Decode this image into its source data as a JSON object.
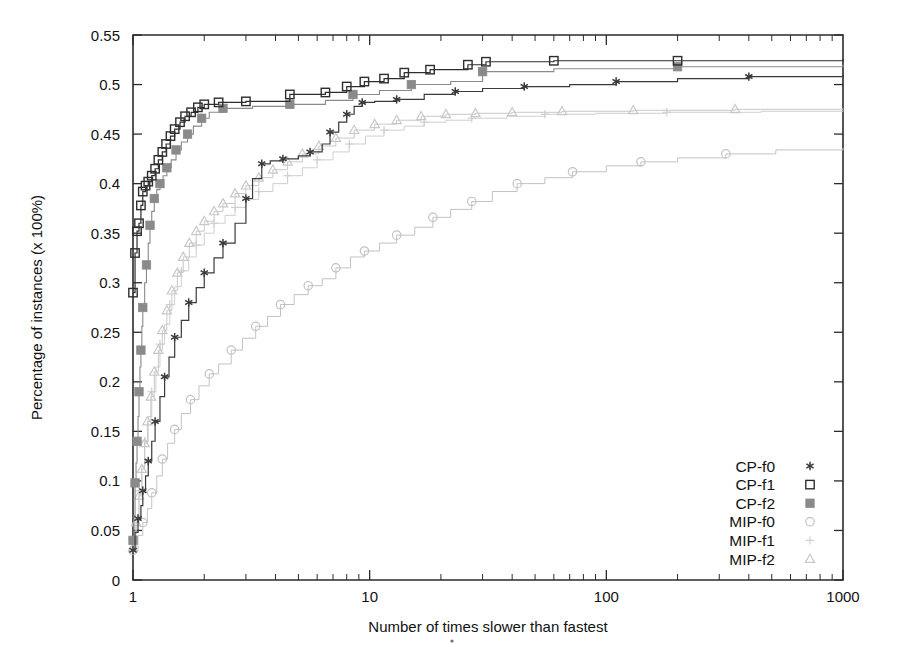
{
  "chart_data": {
    "type": "line",
    "title": "",
    "subtitle": "",
    "xlabel": "Number of times slower than fastest",
    "ylabel": "Percentage of instances (x 100%)",
    "xscale": "log",
    "yscale": "linear",
    "xlim": [
      1,
      1000
    ],
    "ylim": [
      0,
      0.55
    ],
    "xticks": [
      1,
      10,
      100,
      1000
    ],
    "xticklabels": [
      "1",
      "10",
      "100",
      "1000"
    ],
    "yticks": [
      0,
      0.05,
      0.1,
      0.15,
      0.2,
      0.25,
      0.3,
      0.35,
      0.4,
      0.45,
      0.5,
      0.55
    ],
    "yticklabels": [
      "0",
      "0.05",
      "0.1",
      "0.15",
      "0.2",
      "0.25",
      "0.3",
      "0.35",
      "0.4",
      "0.45",
      "0.5",
      "0.55"
    ],
    "grid": false,
    "legend_position": "lower-right",
    "legend": [
      {
        "name": "CP-f0",
        "marker": "asterisk",
        "color": "#3a3a3a"
      },
      {
        "name": "CP-f1",
        "marker": "open-square",
        "color": "#2e2e2e"
      },
      {
        "name": "CP-f2",
        "marker": "filled-square",
        "color": "#8a8a8a"
      },
      {
        "name": "MIP-f0",
        "marker": "open-circle",
        "color": "#c2c2c2"
      },
      {
        "name": "MIP-f1",
        "marker": "plus",
        "color": "#cfcfcf"
      },
      {
        "name": "MIP-f2",
        "marker": "open-triangle",
        "color": "#c8c8c8"
      }
    ],
    "series": [
      {
        "name": "CP-f0",
        "marker": "asterisk",
        "color": "#3a3a3a",
        "linewidth": 1.2,
        "points": [
          [
            1.0,
            0.03
          ],
          [
            1.02,
            0.048
          ],
          [
            1.05,
            0.062
          ],
          [
            1.08,
            0.075
          ],
          [
            1.1,
            0.09
          ],
          [
            1.13,
            0.105
          ],
          [
            1.16,
            0.12
          ],
          [
            1.2,
            0.14
          ],
          [
            1.24,
            0.16
          ],
          [
            1.3,
            0.185
          ],
          [
            1.36,
            0.205
          ],
          [
            1.42,
            0.225
          ],
          [
            1.5,
            0.245
          ],
          [
            1.6,
            0.262
          ],
          [
            1.72,
            0.28
          ],
          [
            1.85,
            0.295
          ],
          [
            2.0,
            0.31
          ],
          [
            2.2,
            0.325
          ],
          [
            2.4,
            0.34
          ],
          [
            2.7,
            0.36
          ],
          [
            3.0,
            0.385
          ],
          [
            3.2,
            0.405
          ],
          [
            3.5,
            0.42
          ],
          [
            3.8,
            0.423
          ],
          [
            4.3,
            0.425
          ],
          [
            5.0,
            0.428
          ],
          [
            5.6,
            0.432
          ],
          [
            6.3,
            0.44
          ],
          [
            6.8,
            0.452
          ],
          [
            7.4,
            0.462
          ],
          [
            8.0,
            0.47
          ],
          [
            8.6,
            0.478
          ],
          [
            9.3,
            0.482
          ],
          [
            10.5,
            0.483
          ],
          [
            13.0,
            0.485
          ],
          [
            17.0,
            0.49
          ],
          [
            23.0,
            0.493
          ],
          [
            30.0,
            0.496
          ],
          [
            45.0,
            0.498
          ],
          [
            70.0,
            0.5
          ],
          [
            110.0,
            0.503
          ],
          [
            200.0,
            0.506
          ],
          [
            400.0,
            0.508
          ],
          [
            1000.0,
            0.51
          ]
        ]
      },
      {
        "name": "CP-f1",
        "marker": "open-square",
        "color": "#2e2e2e",
        "linewidth": 1.2,
        "points": [
          [
            1.0,
            0.29
          ],
          [
            1.02,
            0.33
          ],
          [
            1.04,
            0.352
          ],
          [
            1.06,
            0.36
          ],
          [
            1.08,
            0.378
          ],
          [
            1.1,
            0.392
          ],
          [
            1.13,
            0.398
          ],
          [
            1.16,
            0.402
          ],
          [
            1.2,
            0.408
          ],
          [
            1.24,
            0.415
          ],
          [
            1.28,
            0.424
          ],
          [
            1.33,
            0.432
          ],
          [
            1.38,
            0.44
          ],
          [
            1.44,
            0.448
          ],
          [
            1.5,
            0.455
          ],
          [
            1.58,
            0.462
          ],
          [
            1.66,
            0.468
          ],
          [
            1.76,
            0.472
          ],
          [
            1.88,
            0.477
          ],
          [
            2.0,
            0.48
          ],
          [
            2.3,
            0.482
          ],
          [
            3.0,
            0.483
          ],
          [
            4.6,
            0.49
          ],
          [
            6.5,
            0.492
          ],
          [
            8.0,
            0.498
          ],
          [
            9.5,
            0.503
          ],
          [
            11.5,
            0.506
          ],
          [
            14.0,
            0.512
          ],
          [
            18.0,
            0.515
          ],
          [
            26.0,
            0.52
          ],
          [
            31.0,
            0.523
          ],
          [
            60.0,
            0.524
          ],
          [
            200.0,
            0.524
          ],
          [
            1000.0,
            0.526
          ]
        ]
      },
      {
        "name": "CP-f2",
        "marker": "filled-square",
        "color": "#8a8a8a",
        "linewidth": 1.1,
        "points": [
          [
            1.0,
            0.04
          ],
          [
            1.01,
            0.065
          ],
          [
            1.02,
            0.098
          ],
          [
            1.03,
            0.118
          ],
          [
            1.04,
            0.14
          ],
          [
            1.05,
            0.165
          ],
          [
            1.06,
            0.19
          ],
          [
            1.07,
            0.215
          ],
          [
            1.08,
            0.232
          ],
          [
            1.09,
            0.256
          ],
          [
            1.1,
            0.275
          ],
          [
            1.12,
            0.3
          ],
          [
            1.14,
            0.318
          ],
          [
            1.16,
            0.34
          ],
          [
            1.18,
            0.358
          ],
          [
            1.2,
            0.372
          ],
          [
            1.23,
            0.385
          ],
          [
            1.26,
            0.394
          ],
          [
            1.3,
            0.4
          ],
          [
            1.34,
            0.408
          ],
          [
            1.39,
            0.416
          ],
          [
            1.45,
            0.424
          ],
          [
            1.52,
            0.434
          ],
          [
            1.6,
            0.442
          ],
          [
            1.7,
            0.45
          ],
          [
            1.8,
            0.458
          ],
          [
            1.95,
            0.466
          ],
          [
            2.1,
            0.472
          ],
          [
            2.4,
            0.476
          ],
          [
            3.2,
            0.478
          ],
          [
            4.6,
            0.48
          ],
          [
            6.5,
            0.484
          ],
          [
            8.5,
            0.49
          ],
          [
            11.0,
            0.494
          ],
          [
            15.0,
            0.5
          ],
          [
            22.0,
            0.503
          ],
          [
            30.0,
            0.513
          ],
          [
            60.0,
            0.516
          ],
          [
            200.0,
            0.518
          ],
          [
            1000.0,
            0.52
          ]
        ]
      },
      {
        "name": "MIP-f0",
        "marker": "open-circle",
        "color": "#c2c2c2",
        "linewidth": 1.0,
        "points": [
          [
            1.0,
            0.03
          ],
          [
            1.05,
            0.045
          ],
          [
            1.1,
            0.058
          ],
          [
            1.15,
            0.072
          ],
          [
            1.2,
            0.088
          ],
          [
            1.26,
            0.105
          ],
          [
            1.33,
            0.122
          ],
          [
            1.4,
            0.138
          ],
          [
            1.5,
            0.152
          ],
          [
            1.6,
            0.168
          ],
          [
            1.75,
            0.182
          ],
          [
            1.9,
            0.196
          ],
          [
            2.1,
            0.208
          ],
          [
            2.3,
            0.218
          ],
          [
            2.6,
            0.232
          ],
          [
            2.9,
            0.244
          ],
          [
            3.3,
            0.256
          ],
          [
            3.7,
            0.266
          ],
          [
            4.2,
            0.278
          ],
          [
            4.8,
            0.288
          ],
          [
            5.5,
            0.297
          ],
          [
            6.3,
            0.304
          ],
          [
            7.2,
            0.315
          ],
          [
            8.3,
            0.326
          ],
          [
            9.5,
            0.332
          ],
          [
            11.0,
            0.34
          ],
          [
            13.0,
            0.348
          ],
          [
            15.5,
            0.356
          ],
          [
            18.5,
            0.366
          ],
          [
            22.0,
            0.374
          ],
          [
            27.0,
            0.382
          ],
          [
            33.0,
            0.392
          ],
          [
            42.0,
            0.4
          ],
          [
            55.0,
            0.406
          ],
          [
            72.0,
            0.412
          ],
          [
            100.0,
            0.418
          ],
          [
            140.0,
            0.422
          ],
          [
            200.0,
            0.426
          ],
          [
            320.0,
            0.43
          ],
          [
            520.0,
            0.434
          ],
          [
            1000.0,
            0.436
          ]
        ]
      },
      {
        "name": "MIP-f1",
        "marker": "plus",
        "color": "#cfcfcf",
        "linewidth": 1.0,
        "points": [
          [
            1.0,
            0.03
          ],
          [
            1.03,
            0.06
          ],
          [
            1.06,
            0.09
          ],
          [
            1.09,
            0.115
          ],
          [
            1.12,
            0.14
          ],
          [
            1.16,
            0.165
          ],
          [
            1.2,
            0.19
          ],
          [
            1.25,
            0.215
          ],
          [
            1.3,
            0.238
          ],
          [
            1.36,
            0.258
          ],
          [
            1.43,
            0.278
          ],
          [
            1.5,
            0.296
          ],
          [
            1.6,
            0.312
          ],
          [
            1.72,
            0.326
          ],
          [
            1.85,
            0.338
          ],
          [
            2.0,
            0.35
          ],
          [
            2.2,
            0.36
          ],
          [
            2.45,
            0.368
          ],
          [
            2.7,
            0.376
          ],
          [
            3.0,
            0.384
          ],
          [
            3.4,
            0.392
          ],
          [
            3.9,
            0.4
          ],
          [
            4.5,
            0.408
          ],
          [
            5.2,
            0.416
          ],
          [
            6.0,
            0.424
          ],
          [
            7.0,
            0.432
          ],
          [
            8.2,
            0.44
          ],
          [
            9.6,
            0.448
          ],
          [
            11.5,
            0.454
          ],
          [
            14.0,
            0.458
          ],
          [
            17.0,
            0.462
          ],
          [
            21.0,
            0.464
          ],
          [
            27.0,
            0.466
          ],
          [
            38.0,
            0.468
          ],
          [
            55.0,
            0.47
          ],
          [
            90.0,
            0.471
          ],
          [
            180.0,
            0.472
          ],
          [
            450.0,
            0.473
          ],
          [
            1000.0,
            0.474
          ]
        ]
      },
      {
        "name": "MIP-f2",
        "marker": "open-triangle",
        "color": "#c8c8c8",
        "linewidth": 1.0,
        "points": [
          [
            1.0,
            0.032
          ],
          [
            1.03,
            0.058
          ],
          [
            1.06,
            0.085
          ],
          [
            1.09,
            0.112
          ],
          [
            1.12,
            0.138
          ],
          [
            1.15,
            0.16
          ],
          [
            1.19,
            0.185
          ],
          [
            1.23,
            0.21
          ],
          [
            1.28,
            0.232
          ],
          [
            1.33,
            0.252
          ],
          [
            1.39,
            0.272
          ],
          [
            1.46,
            0.292
          ],
          [
            1.54,
            0.31
          ],
          [
            1.63,
            0.326
          ],
          [
            1.73,
            0.34
          ],
          [
            1.85,
            0.352
          ],
          [
            2.0,
            0.362
          ],
          [
            2.2,
            0.372
          ],
          [
            2.4,
            0.38
          ],
          [
            2.7,
            0.39
          ],
          [
            3.0,
            0.398
          ],
          [
            3.4,
            0.406
          ],
          [
            3.9,
            0.414
          ],
          [
            4.5,
            0.422
          ],
          [
            5.2,
            0.43
          ],
          [
            6.1,
            0.438
          ],
          [
            7.2,
            0.446
          ],
          [
            8.6,
            0.454
          ],
          [
            10.5,
            0.46
          ],
          [
            13.0,
            0.464
          ],
          [
            16.5,
            0.468
          ],
          [
            21.0,
            0.47
          ],
          [
            28.0,
            0.471
          ],
          [
            40.0,
            0.472
          ],
          [
            65.0,
            0.473
          ],
          [
            130.0,
            0.474
          ],
          [
            350.0,
            0.475
          ],
          [
            1000.0,
            0.476
          ]
        ]
      }
    ]
  }
}
